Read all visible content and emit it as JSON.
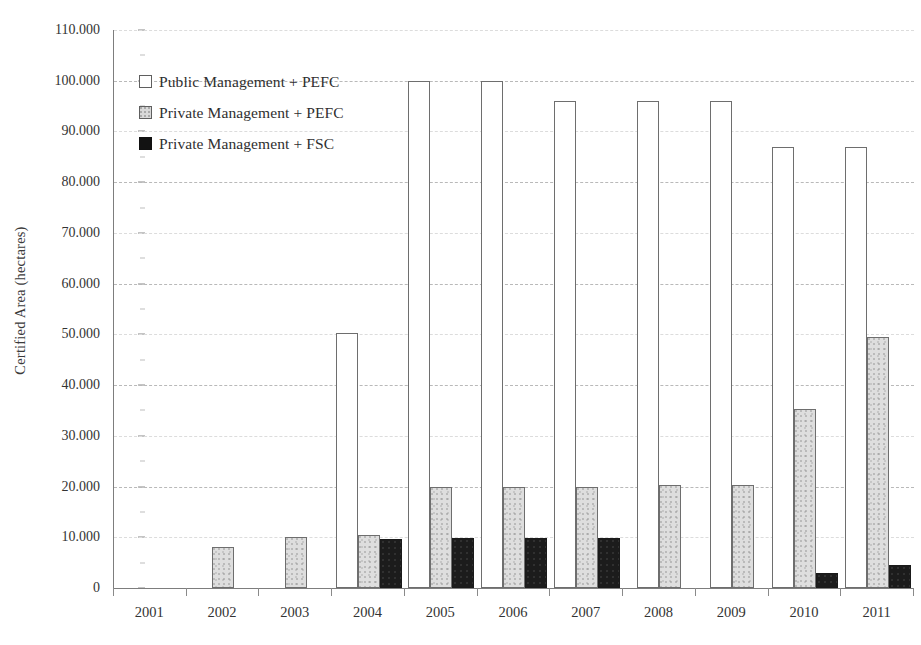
{
  "chart_data": {
    "type": "bar",
    "title": "",
    "xlabel": "",
    "ylabel": "Certified Area (hectares)",
    "ylim": [
      0,
      110000
    ],
    "ytick_interval": 10000,
    "ytick_labels": [
      "0",
      "10.000",
      "20.000",
      "30.000",
      "40.000",
      "50.000",
      "60.000",
      "70.000",
      "80.000",
      "90.000",
      "100.000",
      "110.000"
    ],
    "ytick_values": [
      0,
      10000,
      20000,
      30000,
      40000,
      50000,
      60000,
      70000,
      80000,
      90000,
      100000,
      110000
    ],
    "grid": "horizontal-dashed",
    "legend_position": "top-left-inside",
    "categories": [
      "2001",
      "2002",
      "2003",
      "2004",
      "2005",
      "2006",
      "2007",
      "2008",
      "2009",
      "2010",
      "2011"
    ],
    "series": [
      {
        "name": "Public Management + PEFC",
        "color": "#ffffff",
        "values": [
          0,
          0,
          0,
          50300,
          100000,
          100000,
          96000,
          96000,
          96000,
          87000,
          87000
        ]
      },
      {
        "name": "Private Management + PEFC",
        "color": "#dedede",
        "values": [
          0,
          8000,
          10000,
          10500,
          20000,
          20000,
          20000,
          20300,
          20300,
          35300,
          49500
        ]
      },
      {
        "name": "Private Management + FSC",
        "color": "#1c1c1c",
        "values": [
          0,
          0,
          0,
          9700,
          9900,
          9900,
          9900,
          0,
          0,
          3000,
          4500
        ]
      }
    ]
  },
  "axis": {
    "y_title": "Certified Area (hectares)"
  },
  "legend": {
    "items": [
      {
        "label": "Public Management + PEFC",
        "swatch": "public"
      },
      {
        "label": "Private Management + PEFC",
        "swatch": "private-pefc"
      },
      {
        "label": "Private Management + FSC",
        "swatch": "private-fsc"
      }
    ]
  }
}
